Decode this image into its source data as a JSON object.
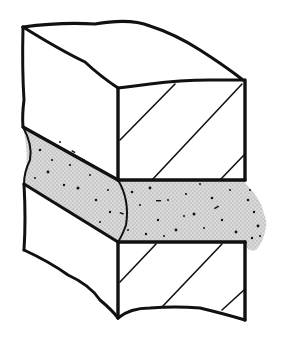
{
  "figure": {
    "description": "Isometric line drawing of a masonry wall section: two hatched brick/stone blocks with a stippled mortar joint between them, mortar extruding beyond the right face",
    "colors": {
      "ink": "#111111",
      "background": "#ffffff",
      "mortar_fill": "#d6d6d6"
    },
    "parts": [
      {
        "name": "upper-block",
        "label": "Upper block"
      },
      {
        "name": "mortar-joint",
        "label": "Mortar joint"
      },
      {
        "name": "lower-block",
        "label": "Lower block"
      },
      {
        "name": "mortar-extrusion",
        "label": "Extruded mortar"
      }
    ]
  }
}
